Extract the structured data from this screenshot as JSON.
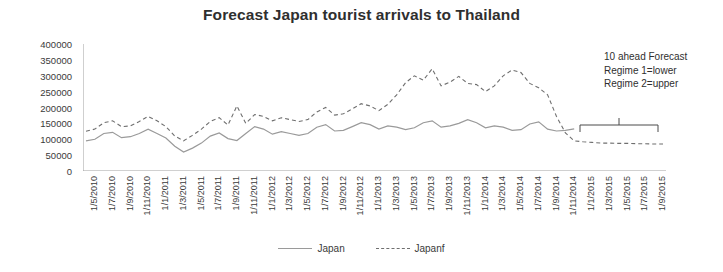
{
  "chart_data": {
    "type": "line",
    "title": "Forecast Japan tourist arrivals to Thailand",
    "xlabel": "",
    "ylabel": "",
    "ylim": [
      0,
      400000
    ],
    "yticks": [
      0,
      50000,
      100000,
      150000,
      200000,
      250000,
      300000,
      350000,
      400000
    ],
    "grid": false,
    "legend_position": "bottom",
    "legend": [
      "Japan",
      "Japanf"
    ],
    "annotation": [
      "10 ahead Forecast",
      "Regime 1=lower",
      "Regime 2=upper"
    ],
    "categories": [
      "1/5/2010",
      "1/6/2010",
      "1/7/2010",
      "1/8/2010",
      "1/9/2010",
      "1/10/2010",
      "1/11/2010",
      "1/12/2010",
      "1/1/2011",
      "1/2/2011",
      "1/3/2011",
      "1/4/2011",
      "1/5/2011",
      "1/6/2011",
      "1/7/2011",
      "1/8/2011",
      "1/9/2011",
      "1/10/2011",
      "1/11/2011",
      "1/12/2011",
      "1/1/2012",
      "1/2/2012",
      "1/3/2012",
      "1/4/2012",
      "1/5/2012",
      "1/6/2012",
      "1/7/2012",
      "1/8/2012",
      "1/9/2012",
      "1/10/2012",
      "1/11/2012",
      "1/12/2012",
      "1/1/2013",
      "1/2/2013",
      "1/3/2013",
      "1/4/2013",
      "1/5/2013",
      "1/6/2013",
      "1/7/2013",
      "1/8/2013",
      "1/9/2013",
      "1/10/2013",
      "1/11/2013",
      "1/12/2013",
      "1/1/2014",
      "1/2/2014",
      "1/3/2014",
      "1/4/2014",
      "1/5/2014",
      "1/6/2014",
      "1/7/2014",
      "1/8/2014",
      "1/9/2014",
      "1/10/2014",
      "1/11/2014",
      "1/12/2014",
      "1/1/2015",
      "1/2/2015",
      "1/3/2015",
      "1/4/2015",
      "1/5/2015",
      "1/6/2015",
      "1/7/2015",
      "1/8/2015",
      "1/9/2015",
      "1/10/2015"
    ],
    "tick_labels_shown": [
      "1/5/2010",
      "1/7/2010",
      "1/9/2010",
      "1/11/2010",
      "1/1/2011",
      "1/3/2011",
      "1/5/2011",
      "1/7/2011",
      "1/9/2011",
      "1/11/2011",
      "1/1/2012",
      "1/3/2012",
      "1/5/2012",
      "1/7/2012",
      "1/9/2012",
      "1/11/2012",
      "1/1/2013",
      "1/3/2013",
      "1/5/2013",
      "1/7/2013",
      "1/9/2013",
      "1/11/2013",
      "1/1/2014",
      "1/3/2014",
      "1/5/2014",
      "1/7/2014",
      "1/9/2014",
      "1/11/2014",
      "1/1/2015",
      "1/3/2015",
      "1/5/2015",
      "1/7/2015",
      "1/9/2015"
    ],
    "series": [
      {
        "name": "Japan",
        "style": "solid",
        "color": "#9a9a9a",
        "values": [
          95000,
          100000,
          118000,
          122000,
          105000,
          108000,
          118000,
          132000,
          118000,
          104000,
          78000,
          60000,
          72000,
          88000,
          110000,
          120000,
          102000,
          96000,
          118000,
          140000,
          132000,
          116000,
          124000,
          118000,
          112000,
          118000,
          138000,
          146000,
          126000,
          128000,
          140000,
          152000,
          146000,
          132000,
          142000,
          138000,
          130000,
          136000,
          152000,
          158000,
          138000,
          142000,
          150000,
          162000,
          152000,
          136000,
          142000,
          138000,
          128000,
          130000,
          148000,
          155000,
          132000,
          126000,
          128000,
          133000,
          null,
          null,
          null,
          null,
          null,
          null,
          null,
          null,
          null,
          null
        ]
      },
      {
        "name": "Japanf",
        "style": "dashed",
        "color": "#6f6f6f",
        "values": [
          125000,
          132000,
          152000,
          158000,
          140000,
          142000,
          156000,
          172000,
          158000,
          140000,
          110000,
          95000,
          112000,
          132000,
          156000,
          168000,
          145000,
          205000,
          150000,
          178000,
          172000,
          158000,
          168000,
          162000,
          156000,
          162000,
          186000,
          200000,
          176000,
          180000,
          196000,
          212000,
          205000,
          190000,
          210000,
          240000,
          278000,
          300000,
          286000,
          322000,
          268000,
          280000,
          298000,
          276000,
          272000,
          250000,
          268000,
          300000,
          318000,
          310000,
          276000,
          262000,
          240000,
          172000,
          120000,
          95000,
          92000,
          90000,
          88000,
          88000,
          87000,
          87000,
          86000,
          86000,
          85000,
          85000
        ]
      }
    ]
  },
  "annotation_text": {
    "line1": "10 ahead Forecast",
    "line2": "Regime 1=lower",
    "line3": "Regime 2=upper"
  },
  "legend": {
    "japan": "Japan",
    "japanf": "Japanf"
  }
}
